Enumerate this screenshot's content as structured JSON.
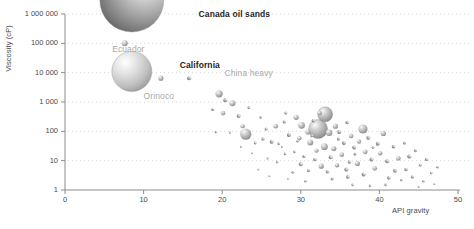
{
  "chart_data": {
    "type": "scatter",
    "title": "",
    "xlabel": "API gravity",
    "ylabel": "Viscosity (cP)",
    "xlim": [
      0,
      50
    ],
    "ylim": [
      1,
      1000000
    ],
    "yscale": "log",
    "xscale": "linear",
    "grid": "horizontal-dotted",
    "legend": "none",
    "xticks": [
      "0",
      "10",
      "20",
      "30",
      "40",
      "50"
    ],
    "xtick_values": [
      0,
      10,
      20,
      30,
      40,
      50
    ],
    "yticks": [
      "1",
      "10",
      "100",
      "1 000",
      "10 000",
      "100 000",
      "1 000 000"
    ],
    "ytick_values": [
      1,
      10,
      100,
      1000,
      10000,
      100000,
      1000000
    ],
    "bubble_size_meaning": "reserve volume",
    "annotations": [
      {
        "label": "Canada oil sands",
        "style": "dark",
        "x": 17.0,
        "y": 900000
      },
      {
        "label": "Ecuador",
        "style": "light",
        "x": 6.0,
        "y": 60000
      },
      {
        "label": "California",
        "style": "light_bold",
        "x": 14.6,
        "y": 17000
      },
      {
        "label": "China heavy",
        "style": "light",
        "x": 20.3,
        "y": 9000
      },
      {
        "label": "Orinoco",
        "style": "light",
        "x": 10.0,
        "y": 1500
      }
    ],
    "points": [
      {
        "name": "Canada oil sands",
        "x": 8.5,
        "y": 3000000,
        "r": 32
      },
      {
        "name": "Ecuador",
        "x": 7.6,
        "y": 100000,
        "r": 3.0
      },
      {
        "name": "Orinoco",
        "x": 8.5,
        "y": 11000,
        "r": 20
      },
      {
        "name": "California",
        "x": 12.2,
        "y": 6500,
        "r": 2.6
      },
      {
        "name": "China heavy",
        "x": 15.8,
        "y": 6500,
        "r": 2.0
      },
      {
        "x": 19.6,
        "y": 1900,
        "r": 3.6
      },
      {
        "x": 20.4,
        "y": 1150,
        "r": 2.0
      },
      {
        "x": 21.3,
        "y": 900,
        "r": 3.0
      },
      {
        "x": 20.1,
        "y": 420,
        "r": 2.4
      },
      {
        "x": 22.1,
        "y": 330,
        "r": 2.0
      },
      {
        "x": 18.8,
        "y": 560,
        "r": 1.5
      },
      {
        "x": 23.4,
        "y": 640,
        "r": 1.4
      },
      {
        "x": 24.9,
        "y": 300,
        "r": 1.3
      },
      {
        "x": 22.6,
        "y": 150,
        "r": 2.2
      },
      {
        "x": 25.6,
        "y": 120,
        "r": 1.6
      },
      {
        "x": 19.2,
        "y": 95,
        "r": 1.2
      },
      {
        "x": 21.0,
        "y": 90,
        "r": 1.1
      },
      {
        "x": 23.0,
        "y": 80,
        "r": 5.6
      },
      {
        "x": 26.8,
        "y": 150,
        "r": 2.4
      },
      {
        "x": 27.9,
        "y": 210,
        "r": 1.6
      },
      {
        "x": 25.2,
        "y": 55,
        "r": 1.6
      },
      {
        "x": 24.2,
        "y": 40,
        "r": 1.4
      },
      {
        "x": 26.3,
        "y": 44,
        "r": 2.0
      },
      {
        "x": 27.2,
        "y": 38,
        "r": 1.3
      },
      {
        "x": 22.4,
        "y": 30,
        "r": 1.0
      },
      {
        "x": 28.5,
        "y": 75,
        "r": 2.0
      },
      {
        "x": 29.4,
        "y": 300,
        "r": 2.6
      },
      {
        "x": 28.1,
        "y": 420,
        "r": 1.5
      },
      {
        "x": 30.1,
        "y": 160,
        "r": 3.4
      },
      {
        "x": 30.9,
        "y": 95,
        "r": 2.6
      },
      {
        "x": 29.8,
        "y": 58,
        "r": 2.2
      },
      {
        "x": 31.6,
        "y": 230,
        "r": 1.8
      },
      {
        "x": 32.4,
        "y": 420,
        "r": 2.2
      },
      {
        "x": 33.1,
        "y": 380,
        "r": 7.5
      },
      {
        "x": 32.2,
        "y": 120,
        "r": 9.5
      },
      {
        "x": 31.2,
        "y": 42,
        "r": 3.0
      },
      {
        "x": 33.6,
        "y": 90,
        "r": 3.2
      },
      {
        "x": 34.4,
        "y": 150,
        "r": 2.6
      },
      {
        "x": 34.9,
        "y": 95,
        "r": 2.0
      },
      {
        "x": 33.0,
        "y": 30,
        "r": 3.4
      },
      {
        "x": 32.0,
        "y": 22,
        "r": 2.2
      },
      {
        "x": 34.2,
        "y": 26,
        "r": 2.6
      },
      {
        "x": 35.5,
        "y": 40,
        "r": 2.0
      },
      {
        "x": 35.9,
        "y": 200,
        "r": 1.8
      },
      {
        "x": 36.4,
        "y": 70,
        "r": 2.4
      },
      {
        "x": 36.8,
        "y": 28,
        "r": 2.0
      },
      {
        "x": 35.2,
        "y": 16,
        "r": 2.4
      },
      {
        "x": 33.8,
        "y": 13,
        "r": 2.0
      },
      {
        "x": 31.8,
        "y": 11,
        "r": 1.8
      },
      {
        "x": 30.4,
        "y": 14,
        "r": 1.6
      },
      {
        "x": 29.2,
        "y": 20,
        "r": 1.4
      },
      {
        "x": 28.0,
        "y": 17,
        "r": 1.3
      },
      {
        "x": 30.0,
        "y": 7.5,
        "r": 2.0
      },
      {
        "x": 32.6,
        "y": 6.5,
        "r": 2.6
      },
      {
        "x": 34.6,
        "y": 7.0,
        "r": 2.2
      },
      {
        "x": 36.2,
        "y": 9.0,
        "r": 1.8
      },
      {
        "x": 37.4,
        "y": 45,
        "r": 2.2
      },
      {
        "x": 37.9,
        "y": 120,
        "r": 4.6
      },
      {
        "x": 38.6,
        "y": 60,
        "r": 2.0
      },
      {
        "x": 38.2,
        "y": 20,
        "r": 2.4
      },
      {
        "x": 39.0,
        "y": 11,
        "r": 2.0
      },
      {
        "x": 37.2,
        "y": 8.0,
        "r": 2.6
      },
      {
        "x": 35.8,
        "y": 5.0,
        "r": 2.0
      },
      {
        "x": 33.4,
        "y": 4.2,
        "r": 1.8
      },
      {
        "x": 31.0,
        "y": 4.6,
        "r": 1.6
      },
      {
        "x": 29.0,
        "y": 4.0,
        "r": 1.4
      },
      {
        "x": 27.0,
        "y": 9.0,
        "r": 1.2
      },
      {
        "x": 25.8,
        "y": 12,
        "r": 1.1
      },
      {
        "x": 39.8,
        "y": 38,
        "r": 2.0
      },
      {
        "x": 40.5,
        "y": 85,
        "r": 2.6
      },
      {
        "x": 40.1,
        "y": 18,
        "r": 2.2
      },
      {
        "x": 41.0,
        "y": 9.5,
        "r": 2.0
      },
      {
        "x": 39.4,
        "y": 5.5,
        "r": 2.4
      },
      {
        "x": 38.0,
        "y": 3.4,
        "r": 2.0
      },
      {
        "x": 36.0,
        "y": 2.8,
        "r": 1.8
      },
      {
        "x": 34.0,
        "y": 2.4,
        "r": 1.6
      },
      {
        "x": 41.8,
        "y": 30,
        "r": 1.8
      },
      {
        "x": 42.4,
        "y": 12,
        "r": 2.4
      },
      {
        "x": 42.0,
        "y": 4.5,
        "r": 2.0
      },
      {
        "x": 41.2,
        "y": 2.6,
        "r": 1.8
      },
      {
        "x": 43.2,
        "y": 40,
        "r": 1.6
      },
      {
        "x": 43.8,
        "y": 14,
        "r": 2.0
      },
      {
        "x": 43.4,
        "y": 5.0,
        "r": 1.8
      },
      {
        "x": 44.6,
        "y": 22,
        "r": 1.6
      },
      {
        "x": 45.2,
        "y": 7.0,
        "r": 1.4
      },
      {
        "x": 44.2,
        "y": 2.8,
        "r": 1.6
      },
      {
        "x": 46.0,
        "y": 11,
        "r": 1.6
      },
      {
        "x": 46.6,
        "y": 3.8,
        "r": 1.3
      },
      {
        "x": 47.4,
        "y": 6.0,
        "r": 1.2
      },
      {
        "x": 45.6,
        "y": 2.0,
        "r": 1.2
      },
      {
        "x": 47.0,
        "y": 1.6,
        "r": 1.0
      },
      {
        "x": 40.8,
        "y": 1.5,
        "r": 1.4
      },
      {
        "x": 38.8,
        "y": 1.4,
        "r": 1.2
      },
      {
        "x": 36.6,
        "y": 1.5,
        "r": 1.3
      },
      {
        "x": 30.6,
        "y": 2.0,
        "r": 1.2
      },
      {
        "x": 28.4,
        "y": 2.4,
        "r": 1.0
      },
      {
        "x": 26.0,
        "y": 3.0,
        "r": 1.0
      },
      {
        "x": 24.6,
        "y": 5.0,
        "r": 0.9
      },
      {
        "x": 23.8,
        "y": 18,
        "r": 0.9
      },
      {
        "x": 27.6,
        "y": 30,
        "r": 1.0
      },
      {
        "x": 29.6,
        "y": 46,
        "r": 1.2
      },
      {
        "x": 31.4,
        "y": 70,
        "r": 1.4
      },
      {
        "x": 34.8,
        "y": 55,
        "r": 1.6
      },
      {
        "x": 36.9,
        "y": 17,
        "r": 1.5
      },
      {
        "x": 39.2,
        "y": 28,
        "r": 1.4
      },
      {
        "x": 42.8,
        "y": 2.2,
        "r": 1.2
      },
      {
        "x": 45.0,
        "y": 1.3,
        "r": 1.0
      }
    ]
  },
  "colors": {
    "axis": "#8c8c8c",
    "gridline": "#d8d8d8",
    "bubble_light": "#f2f2f2",
    "bubble_mid": "#b0b0b0",
    "bubble_dark": "#6e6e6e",
    "bubble_darkest": "#4a4a4a",
    "text": "#4a4a4a",
    "annotation_dark": "#1f1f1f",
    "annotation_light": "#a9a9a9",
    "background": "#ffffff"
  }
}
